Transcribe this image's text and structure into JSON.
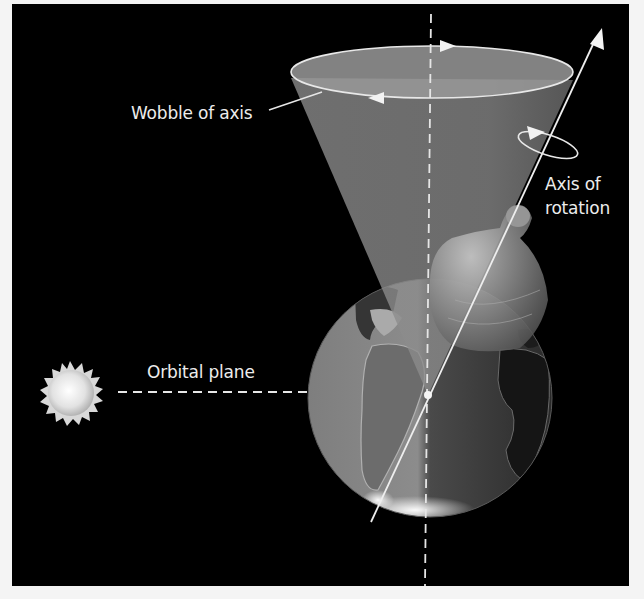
{
  "figure": {
    "background_color": "#000000",
    "frame_color": "#f4f4f4",
    "line_color": "#e6e6e6",
    "cone_color": "#8c8c8c",
    "earth_light_color": "#8a8a8a",
    "earth_dark_color": "#3a3a3a",
    "labels": {
      "wobble": "Wobble of axis",
      "axis_line1": "Axis of",
      "axis_line2": "rotation",
      "orbital": "Orbital plane"
    },
    "elements": {
      "sun": "sun-icon",
      "earth": "earth-globe",
      "spinning_top": "spinning-top",
      "precession_cone": "precession-cone",
      "rotation_axis": "rotation-axis-arrow",
      "vertical_reference": "vertical-dashed-line",
      "orbital_plane_line": "horizontal-dashed-line"
    }
  }
}
